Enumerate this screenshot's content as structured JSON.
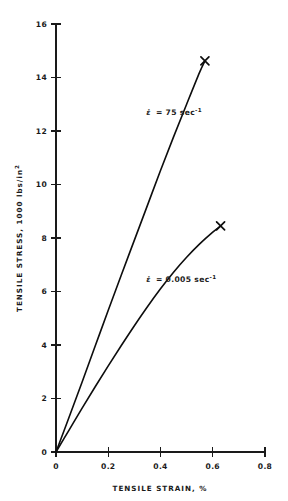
{
  "figure": {
    "background_color": "#ffffff",
    "ink_color": "#111111"
  },
  "chart_data": {
    "type": "line",
    "title": "",
    "subtitle": "",
    "xlabel": "TENSILE STRAIN, %",
    "ylabel": "TENSILE STRESS, 1000 lbs/in2",
    "ylabel_parts": {
      "main": "TENSILE STRESS, 1000 lbs/in",
      "exponent": "2"
    },
    "xlabel_parts": {
      "main": "TENSILE STRAIN, %"
    },
    "xlim": [
      0,
      0.8
    ],
    "ylim": [
      0,
      16
    ],
    "xticks": [
      0,
      0.2,
      0.4,
      0.6,
      0.8
    ],
    "xtick_labels": [
      "0",
      "0.2",
      "0.4",
      "0.6",
      "0.8"
    ],
    "yticks": [
      0,
      2,
      4,
      6,
      8,
      10,
      12,
      14,
      16
    ],
    "ytick_labels": [
      "0",
      "2",
      "4",
      "6",
      "8",
      "10",
      "12",
      "14",
      "16"
    ],
    "grid": false,
    "legend_position": "inline-annotation",
    "marker_style": "x",
    "series": [
      {
        "name": "strain rate 75 per second",
        "annotation_main": "= 75 sec",
        "annotation_symbol": "ε̇",
        "annotation_exponent": "-1",
        "annotation_full": "ε̇ = 75 sec-1",
        "annotation_x": 0.345,
        "annotation_y": 12.6,
        "endpoint_marker": "x",
        "x": [
          0,
          0.05,
          0.1,
          0.15,
          0.2,
          0.25,
          0.3,
          0.35,
          0.4,
          0.45,
          0.5,
          0.55,
          0.57
        ],
        "y": [
          0,
          1.3,
          2.62,
          3.96,
          5.3,
          6.62,
          7.92,
          9.22,
          10.52,
          11.78,
          13.0,
          14.2,
          14.62
        ],
        "endpoint": {
          "x": 0.57,
          "y": 14.62
        }
      },
      {
        "name": "strain rate 0.005 per second",
        "annotation_main": "= 0.005 sec",
        "annotation_symbol": "ε̇",
        "annotation_exponent": "-1",
        "annotation_full": "ε̇ = 0.005 sec-1",
        "annotation_x": 0.345,
        "annotation_y": 6.35,
        "endpoint_marker": "x",
        "x": [
          0,
          0.05,
          0.1,
          0.15,
          0.2,
          0.25,
          0.3,
          0.35,
          0.4,
          0.45,
          0.5,
          0.55,
          0.6,
          0.63
        ],
        "y": [
          0,
          0.82,
          1.64,
          2.44,
          3.22,
          3.98,
          4.72,
          5.43,
          6.1,
          6.72,
          7.28,
          7.78,
          8.22,
          8.45
        ],
        "endpoint": {
          "x": 0.63,
          "y": 8.45
        }
      }
    ]
  }
}
